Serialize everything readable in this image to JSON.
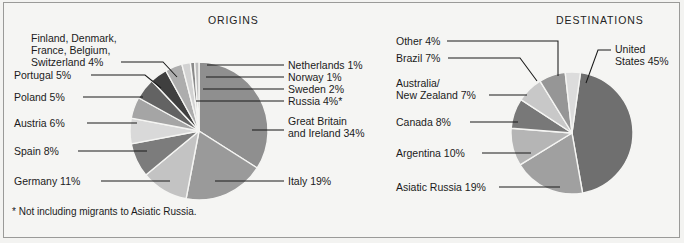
{
  "figure": {
    "background_color": "#f5f5f3",
    "frame_color": "#9a9a98",
    "footnote": "* Not including migrants to Asiatic Russia."
  },
  "charts": [
    {
      "id": "origins",
      "title": "ORIGINS",
      "title_x": 208,
      "title_y": 24,
      "center_x": 199,
      "center_y": 131,
      "radius": 69,
      "start_angle": -90,
      "slices": [
        {
          "name": "great-britain-and-ireland",
          "label": "Great Britain",
          "label2": "and Ireland  34%",
          "value": 34,
          "color": "#8f8f8f",
          "label_x": 288,
          "label_y": 125,
          "label2_y": 137,
          "leader": "M 284,130 L 252,130"
        },
        {
          "name": "italy",
          "label": "Italy  19%",
          "value": 19,
          "color": "#9a9a9a",
          "label_x": 288,
          "label_y": 185,
          "leader": "M 284,181 L 215,181"
        },
        {
          "name": "germany",
          "label": "Germany  11%",
          "value": 11,
          "color": "#c3c3c3",
          "label_x": 14,
          "label_y": 185,
          "leader": "M 101,181 L 170,181"
        },
        {
          "name": "spain",
          "label": "Spain  8%",
          "value": 8,
          "color": "#7c7c7c",
          "label_x": 14,
          "label_y": 155,
          "leader": "M 78,151 L 147,151"
        },
        {
          "name": "austria",
          "label": "Austria  6%",
          "value": 6,
          "color": "#d9d9d9",
          "label_x": 14,
          "label_y": 127,
          "leader": "M 87,123 L 137,123"
        },
        {
          "name": "poland",
          "label": "Poland  5%",
          "value": 5,
          "color": "#a5a5a5",
          "label_x": 14,
          "label_y": 101,
          "leader": "M 83,97 L 143,97"
        },
        {
          "name": "portugal",
          "label": "Portugal  5%",
          "value": 5,
          "color": "#636363",
          "label_x": 14,
          "label_y": 79,
          "leader": "M 91,75 L 145,75 L 161,88"
        },
        {
          "name": "finland-denmark-france-belgium-switzerland",
          "label": "Finland, Denmark,",
          "label2": "France, Belgium,",
          "label3": "Switzerland  4%",
          "value": 4,
          "color": "#3f3f3f",
          "label_x": 31,
          "label_y": 42,
          "label2_y": 54,
          "label3_y": 66,
          "leader": "M 121,62 L 163,62 L 177,77"
        },
        {
          "name": "russia",
          "label": "Russia  4%*",
          "value": 4,
          "color": "#adadad",
          "label_x": 288,
          "label_y": 105,
          "leader": "M 284,101 L 196,101"
        },
        {
          "name": "sweden",
          "label": "Sweden  2%",
          "value": 2,
          "color": "#d2d2d2",
          "label_x": 288,
          "label_y": 93,
          "leader": "M 284,89 L 203,89"
        },
        {
          "name": "norway",
          "label": "Norway  1%",
          "value": 1,
          "color": "#8a8a8a",
          "label_x": 288,
          "label_y": 81,
          "leader": "M 284,77 L 206,77"
        },
        {
          "name": "netherlands",
          "label": "Netherlands  1%",
          "value": 1,
          "color": "#bdbdbd",
          "label_x": 288,
          "label_y": 69,
          "leader": "M 284,65 L 207,65"
        }
      ]
    },
    {
      "id": "destinations",
      "title": "DESTINATIONS",
      "title_x": 556,
      "title_y": 24,
      "center_x": 572,
      "center_y": 133,
      "radius": 61,
      "start_angle": -82,
      "slices": [
        {
          "name": "united-states",
          "label": "United",
          "label2": "States  45%",
          "value": 45,
          "color": "#6f6f6f",
          "label_x": 615,
          "label_y": 53,
          "label2_y": 65,
          "leader": "M 611,50 L 598,50 L 586,83"
        },
        {
          "name": "asiatic-russia",
          "label": "Asiatic Russia  19%",
          "value": 19,
          "color": "#a0a0a0",
          "label_x": 396,
          "label_y": 191,
          "leader": "M 499,187 L 560,187"
        },
        {
          "name": "argentina",
          "label": "Argentina  10%",
          "value": 10,
          "color": "#b5b5b5",
          "label_x": 396,
          "label_y": 157,
          "leader": "M 482,153 L 531,153"
        },
        {
          "name": "canada",
          "label": "Canada  8%",
          "value": 8,
          "color": "#787878",
          "label_x": 396,
          "label_y": 126,
          "leader": "M 470,122 L 518,122"
        },
        {
          "name": "australia-new-zealand",
          "label": "Australia/",
          "label2": "New Zealand  7%",
          "value": 7,
          "color": "#c8c8c8",
          "label_x": 396,
          "label_y": 87,
          "label2_y": 99,
          "leader": "M 489,95 L 527,95"
        },
        {
          "name": "brazil",
          "label": "Brazil  7%",
          "value": 7,
          "color": "#969696",
          "label_x": 396,
          "label_y": 62,
          "leader": "M 448,58 L 520,58 L 537,81"
        },
        {
          "name": "other",
          "label": "Other  4%",
          "value": 4,
          "color": "#dcdcdc",
          "label_x": 396,
          "label_y": 45,
          "leader": "M 447,41 L 558,41 L 558,76"
        }
      ]
    }
  ]
}
